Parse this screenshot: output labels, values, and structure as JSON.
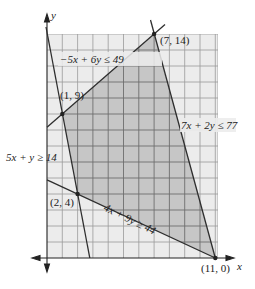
{
  "axes": {
    "x_label": "x",
    "y_label": "y"
  },
  "grid": {
    "x_min": 0,
    "x_max": 11,
    "y_min": 0,
    "y_max": 14
  },
  "colors": {
    "grid_bg": "#ececec",
    "grid_line": "#9a9a9a",
    "shaded": "#c6c6c6",
    "shaded_line": "#707070",
    "line": "#333333"
  },
  "constraints": [
    {
      "label": "−5x + 6y ≤ 49"
    },
    {
      "label": "7x + 2y ≤ 77"
    },
    {
      "label": "5x + y ≥ 14"
    },
    {
      "label": "4x + 9y ≥ 44"
    }
  ],
  "vertices": [
    {
      "label": "(1, 9)",
      "x": 1,
      "y": 9
    },
    {
      "label": "(7, 14)",
      "x": 7,
      "y": 14
    },
    {
      "label": "(11, 0)",
      "x": 11,
      "y": 0
    },
    {
      "label": "(2, 4)",
      "x": 2,
      "y": 4
    }
  ]
}
